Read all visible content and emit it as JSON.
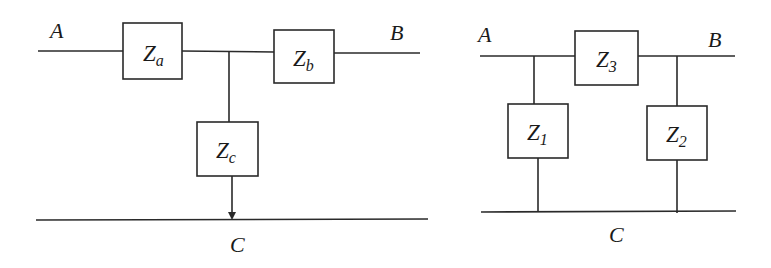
{
  "diagrams": [
    {
      "name": "T-network (star)",
      "nodes": {
        "a": "A",
        "b": "B",
        "c": "C"
      },
      "impedances": [
        {
          "id": "Za",
          "main": "Z",
          "sub": "a"
        },
        {
          "id": "Zb",
          "main": "Z",
          "sub": "b"
        },
        {
          "id": "Zc",
          "main": "Z",
          "sub": "c"
        }
      ]
    },
    {
      "name": "Pi-network (delta)",
      "nodes": {
        "a": "A",
        "b": "B",
        "c": "C"
      },
      "impedances": [
        {
          "id": "Z3",
          "main": "Z",
          "sub": "3"
        },
        {
          "id": "Z1",
          "main": "Z",
          "sub": "1"
        },
        {
          "id": "Z2",
          "main": "Z",
          "sub": "2"
        }
      ]
    }
  ],
  "colors": {
    "stroke": "#2a2a2a",
    "text": "#1a1a1a",
    "background": "#ffffff"
  }
}
